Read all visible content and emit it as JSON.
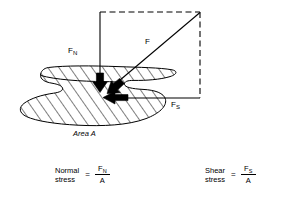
{
  "figure": {
    "type": "engineering-diagram",
    "labels": {
      "normal_force": "F",
      "normal_force_sub": "N",
      "resultant_force": "F",
      "shear_force": "F",
      "shear_force_sub": "S",
      "area": "Area A"
    },
    "formulas": [
      {
        "name_line1": "Normal",
        "name_line2": "stress",
        "equals": "=",
        "numerator": "F",
        "numerator_sub": "N",
        "denominator": "A"
      },
      {
        "name_line1": "Shear",
        "name_line2": "stress",
        "equals": "=",
        "numerator": "F",
        "numerator_sub": "S",
        "denominator": "A"
      }
    ],
    "colors": {
      "stroke": "#000000",
      "background": "#ffffff",
      "arrow_fill": "#000000",
      "hatch": "#000000"
    },
    "construction": {
      "dashed_top_edge": true,
      "dashed_right_edge": true,
      "solid_left_edge": true,
      "solid_bottom_edge": true,
      "hatch_angle_deg": 35,
      "arrow_count": 3
    }
  }
}
